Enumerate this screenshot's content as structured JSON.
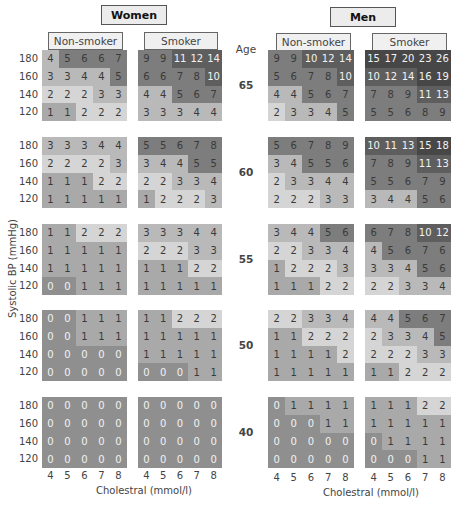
{
  "chart_data": {
    "type": "heatmap",
    "title": "",
    "xlabel": "Cholestral (mmol/l)",
    "ylabel": "Systolic BP (mmHg)",
    "age_label": "Age",
    "sexes": [
      "Women",
      "Men"
    ],
    "smoking": [
      "Non-smoker",
      "Smoker"
    ],
    "cholesterol": [
      4,
      5,
      6,
      7,
      8
    ],
    "systolic_bp": [
      180,
      160,
      140,
      120
    ],
    "ages": [
      65,
      60,
      55,
      50,
      40
    ],
    "grids": {
      "women_nonsmoker": {
        "65": [
          [
            4,
            5,
            6,
            6,
            7
          ],
          [
            3,
            3,
            4,
            4,
            5
          ],
          [
            2,
            2,
            2,
            3,
            3
          ],
          [
            1,
            1,
            2,
            2,
            2
          ]
        ],
        "60": [
          [
            3,
            3,
            3,
            4,
            4
          ],
          [
            2,
            2,
            2,
            2,
            3
          ],
          [
            1,
            1,
            1,
            2,
            2
          ],
          [
            1,
            1,
            1,
            1,
            1
          ]
        ],
        "55": [
          [
            1,
            1,
            2,
            2,
            2
          ],
          [
            1,
            1,
            1,
            1,
            1
          ],
          [
            1,
            1,
            1,
            1,
            1
          ],
          [
            0,
            0,
            1,
            1,
            1
          ]
        ],
        "50": [
          [
            0,
            0,
            1,
            1,
            1
          ],
          [
            0,
            0,
            1,
            1,
            1
          ],
          [
            0,
            0,
            0,
            0,
            0
          ],
          [
            0,
            0,
            0,
            0,
            0
          ]
        ],
        "40": [
          [
            0,
            0,
            0,
            0,
            0
          ],
          [
            0,
            0,
            0,
            0,
            0
          ],
          [
            0,
            0,
            0,
            0,
            0
          ],
          [
            0,
            0,
            0,
            0,
            0
          ]
        ]
      },
      "women_smoker": {
        "65": [
          [
            9,
            9,
            11,
            12,
            14
          ],
          [
            6,
            6,
            7,
            8,
            10
          ],
          [
            4,
            4,
            5,
            6,
            7
          ],
          [
            3,
            3,
            3,
            4,
            4
          ]
        ],
        "60": [
          [
            5,
            5,
            6,
            7,
            8
          ],
          [
            3,
            4,
            4,
            5,
            5
          ],
          [
            2,
            2,
            3,
            3,
            4
          ],
          [
            1,
            2,
            2,
            2,
            3
          ]
        ],
        "55": [
          [
            3,
            3,
            3,
            4,
            4
          ],
          [
            2,
            2,
            2,
            3,
            3
          ],
          [
            1,
            1,
            1,
            2,
            2
          ],
          [
            1,
            1,
            1,
            1,
            1
          ]
        ],
        "50": [
          [
            1,
            1,
            2,
            2,
            2
          ],
          [
            1,
            1,
            1,
            1,
            1
          ],
          [
            1,
            1,
            1,
            1,
            1
          ],
          [
            0,
            0,
            0,
            1,
            1
          ]
        ],
        "40": [
          [
            0,
            0,
            0,
            0,
            0
          ],
          [
            0,
            0,
            0,
            0,
            0
          ],
          [
            0,
            0,
            0,
            0,
            0
          ],
          [
            0,
            0,
            0,
            0,
            0
          ]
        ]
      },
      "men_nonsmoker": {
        "65": [
          [
            9,
            9,
            10,
            12,
            14
          ],
          [
            5,
            6,
            7,
            8,
            10
          ],
          [
            4,
            4,
            5,
            6,
            7
          ],
          [
            2,
            3,
            3,
            4,
            5
          ]
        ],
        "60": [
          [
            5,
            6,
            7,
            8,
            9
          ],
          [
            3,
            4,
            5,
            5,
            6
          ],
          [
            2,
            3,
            3,
            4,
            4
          ],
          [
            2,
            2,
            2,
            3,
            3
          ]
        ],
        "55": [
          [
            3,
            4,
            4,
            5,
            6
          ],
          [
            2,
            2,
            3,
            3,
            4
          ],
          [
            1,
            2,
            2,
            2,
            3
          ],
          [
            1,
            1,
            1,
            2,
            2
          ]
        ],
        "50": [
          [
            2,
            2,
            3,
            3,
            4
          ],
          [
            1,
            1,
            2,
            2,
            2
          ],
          [
            1,
            1,
            1,
            1,
            2
          ],
          [
            1,
            1,
            1,
            1,
            1
          ]
        ],
        "40": [
          [
            0,
            1,
            1,
            1,
            1
          ],
          [
            0,
            0,
            0,
            1,
            1
          ],
          [
            0,
            0,
            0,
            0,
            0
          ],
          [
            0,
            0,
            0,
            0,
            0
          ]
        ]
      },
      "men_smoker": {
        "65": [
          [
            15,
            17,
            20,
            23,
            26
          ],
          [
            10,
            12,
            14,
            16,
            19
          ],
          [
            7,
            8,
            9,
            11,
            13
          ],
          [
            5,
            5,
            6,
            8,
            9
          ]
        ],
        "60": [
          [
            10,
            11,
            13,
            15,
            18
          ],
          [
            7,
            8,
            9,
            11,
            13
          ],
          [
            5,
            5,
            6,
            7,
            9
          ],
          [
            3,
            4,
            4,
            5,
            6
          ]
        ],
        "55": [
          [
            6,
            7,
            8,
            10,
            12
          ],
          [
            4,
            5,
            6,
            7,
            6
          ],
          [
            3,
            3,
            4,
            5,
            6
          ],
          [
            2,
            2,
            3,
            3,
            4
          ]
        ],
        "50": [
          [
            4,
            4,
            5,
            6,
            7
          ],
          [
            2,
            3,
            3,
            4,
            5
          ],
          [
            2,
            2,
            2,
            3,
            3
          ],
          [
            1,
            1,
            2,
            2,
            2
          ]
        ],
        "40": [
          [
            1,
            1,
            1,
            2,
            2
          ],
          [
            1,
            1,
            1,
            1,
            1
          ],
          [
            0,
            1,
            1,
            1,
            1
          ],
          [
            0,
            0,
            0,
            1,
            1
          ]
        ]
      }
    },
    "color_scale": {
      "0": "#8f8f8f",
      "1": "#a9a9a9",
      "2": "#d5d5d5",
      "3-4": "#b9b9b9",
      "5-9": "#7d7d7d",
      "10-14": "#5e5e5e",
      "15+": "#474747"
    }
  },
  "labels": {
    "women": "Women",
    "men": "Men",
    "non_smoker": "Non-smoker",
    "smoker": "Smoker",
    "age": "Age",
    "y_axis": "Systolic BP (mmHg)",
    "x_axis": "Cholestral (mmol/l)",
    "bp": [
      "180",
      "160",
      "140",
      "120"
    ],
    "ages": [
      "65",
      "60",
      "55",
      "50",
      "40"
    ],
    "chol": [
      "4",
      "5",
      "6",
      "7",
      "8"
    ]
  }
}
